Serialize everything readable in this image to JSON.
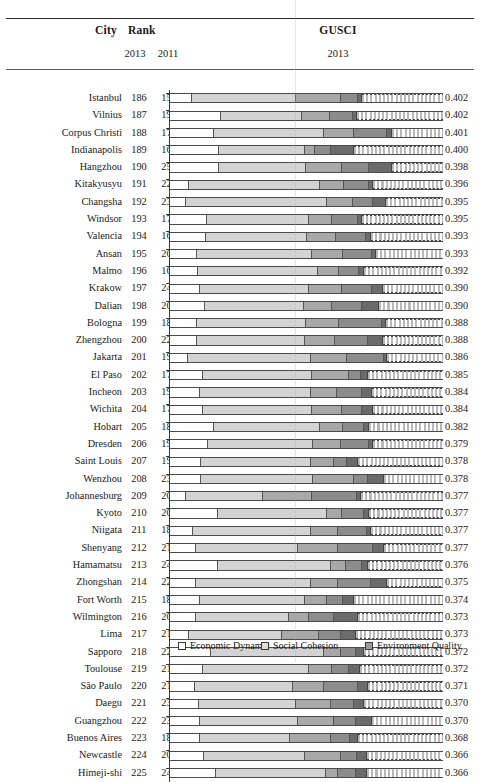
{
  "header": {
    "city_label": "City",
    "rank_label": "Rank",
    "rank_year_1": "2013",
    "rank_year_2": "2011",
    "gusci_label": "GUSCI",
    "gusci_year": "2013"
  },
  "legend": {
    "items": [
      {
        "name": "economic-dynamic",
        "label": "Economic Dynamic",
        "color": "#ffffff"
      },
      {
        "name": "social-cohesion",
        "label": "Social Cohesion",
        "color": "#dcdcdc"
      },
      {
        "name": "environment-quality",
        "label": "Environment Quality",
        "color": "#9c9c9c"
      }
    ]
  },
  "chart_data": {
    "type": "bar",
    "title": "",
    "subtitle": "",
    "xlabel": "",
    "ylabel": "",
    "grid": false,
    "legend_position": "bottom",
    "stacked": true,
    "series_names": [
      "Economic Dynamic",
      "Social Cohesion",
      "Environment Quality"
    ],
    "columns": [
      "City",
      "Rank 2013",
      "Rank 2011",
      "GUSCI 2013"
    ],
    "rows": [
      {
        "city": "Istanbul",
        "rank2013": "186",
        "rank2011": "158",
        "gusci": "0.402",
        "segs": [
          0.08,
          0.38,
          0.165,
          0.062,
          0.018
        ]
      },
      {
        "city": "Vilnius",
        "rank2013": "187",
        "rank2011": "197",
        "gusci": "0.402",
        "segs": [
          0.185,
          0.3,
          0.1,
          0.087,
          0.014
        ]
      },
      {
        "city": "Corpus Christi",
        "rank2013": "188",
        "rank2011": "173",
        "gusci": "0.401",
        "segs": [
          0.16,
          0.405,
          0.11,
          0.12,
          0.02
        ]
      },
      {
        "city": "Indianapolis",
        "rank2013": "189",
        "rank2011": "168",
        "gusci": "0.400",
        "segs": [
          0.18,
          0.315,
          0.035,
          0.06,
          0.085
        ]
      },
      {
        "city": "Hangzhou",
        "rank2013": "190",
        "rank2011": "251",
        "gusci": "0.398",
        "segs": [
          0.18,
          0.32,
          0.13,
          0.1,
          0.085
        ]
      },
      {
        "city": "Kitakyusyu",
        "rank2013": "191",
        "rank2011": "228",
        "gusci": "0.396",
        "segs": [
          0.068,
          0.48,
          0.09,
          0.09,
          0.015
        ]
      },
      {
        "city": "Changsha",
        "rank2013": "192",
        "rank2011": "234",
        "gusci": "0.395",
        "segs": [
          0.06,
          0.515,
          0.095,
          0.075,
          0.045
        ]
      },
      {
        "city": "Windsor",
        "rank2013": "193",
        "rank2011": "179",
        "gusci": "0.395",
        "segs": [
          0.135,
          0.375,
          0.085,
          0.095,
          0.015
        ]
      },
      {
        "city": "Valencia",
        "rank2013": "194",
        "rank2011": "167",
        "gusci": "0.393",
        "segs": [
          0.133,
          0.37,
          0.105,
          0.11,
          0.02
        ]
      },
      {
        "city": "Ansan",
        "rank2013": "195",
        "rank2011": "202",
        "gusci": "0.393",
        "segs": [
          0.1,
          0.42,
          0.115,
          0.105,
          0.013
        ]
      },
      {
        "city": "Malmo",
        "rank2013": "196",
        "rank2011": "160",
        "gusci": "0.392",
        "segs": [
          0.103,
          0.44,
          0.075,
          0.075,
          0.018
        ]
      },
      {
        "city": "Krakow",
        "rank2013": "197",
        "rank2011": "248",
        "gusci": "0.390",
        "segs": [
          0.11,
          0.4,
          0.12,
          0.11,
          0.04
        ]
      },
      {
        "city": "Dalian",
        "rank2013": "198",
        "rank2011": "207",
        "gusci": "0.390",
        "segs": [
          0.13,
          0.36,
          0.105,
          0.11,
          0.06
        ]
      },
      {
        "city": "Bologna",
        "rank2013": "199",
        "rank2011": "184",
        "gusci": "0.388",
        "segs": [
          0.1,
          0.4,
          0.12,
          0.155,
          0.015
        ]
      },
      {
        "city": "Zhengzhou",
        "rank2013": "200",
        "rank2011": "222",
        "gusci": "0.388",
        "segs": [
          0.1,
          0.395,
          0.11,
          0.12,
          0.055
        ]
      },
      {
        "city": "Jakarta",
        "rank2013": "201",
        "rank2011": "196",
        "gusci": "0.386",
        "segs": [
          0.065,
          0.45,
          0.135,
          0.135,
          0.01
        ]
      },
      {
        "city": "El Paso",
        "rank2013": "202",
        "rank2011": "170",
        "gusci": "0.385",
        "segs": [
          0.12,
          0.4,
          0.135,
          0.045,
          0.025
        ]
      },
      {
        "city": "Incheon",
        "rank2013": "203",
        "rank2011": "199",
        "gusci": "0.384",
        "segs": [
          0.11,
          0.405,
          0.095,
          0.095,
          0.035
        ]
      },
      {
        "city": "Wichita",
        "rank2013": "204",
        "rank2011": "174",
        "gusci": "0.384",
        "segs": [
          0.12,
          0.4,
          0.11,
          0.075,
          0.04
        ]
      },
      {
        "city": "Hobart",
        "rank2013": "205",
        "rank2011": "180",
        "gusci": "0.382",
        "segs": [
          0.16,
          0.39,
          0.085,
          0.075,
          0.018
        ]
      },
      {
        "city": "Dresden",
        "rank2013": "206",
        "rank2011": "194",
        "gusci": "0.379",
        "segs": [
          0.14,
          0.385,
          0.1,
          0.105,
          0.015
        ]
      },
      {
        "city": "Saint Louis",
        "rank2013": "207",
        "rank2011": "191",
        "gusci": "0.378",
        "segs": [
          0.115,
          0.4,
          0.085,
          0.05,
          0.04
        ]
      },
      {
        "city": "Wenzhou",
        "rank2013": "208",
        "rank2011": "235",
        "gusci": "0.378",
        "segs": [
          0.115,
          0.41,
          0.15,
          0.05,
          0.06
        ]
      },
      {
        "city": "Johannesburg",
        "rank2013": "209",
        "rank2011": "204",
        "gusci": "0.377",
        "segs": [
          0.06,
          0.28,
          0.18,
          0.165,
          0.015
        ]
      },
      {
        "city": "Kyoto",
        "rank2013": "210",
        "rank2011": "209",
        "gusci": "0.377",
        "segs": [
          0.175,
          0.4,
          0.055,
          0.08,
          0.02
        ]
      },
      {
        "city": "Niigata",
        "rank2013": "211",
        "rank2011": "183",
        "gusci": "0.377",
        "segs": [
          0.085,
          0.43,
          0.1,
          0.105,
          0.015
        ]
      },
      {
        "city": "Shenyang",
        "rank2013": "212",
        "rank2011": "212",
        "gusci": "0.377",
        "segs": [
          0.095,
          0.375,
          0.145,
          0.13,
          0.04
        ]
      },
      {
        "city": "Hamamatsu",
        "rank2013": "213",
        "rank2011": "242",
        "gusci": "0.376",
        "segs": [
          0.175,
          0.415,
          0.055,
          0.06,
          0.02
        ]
      },
      {
        "city": "Zhongshan",
        "rank2013": "214",
        "rank2011": "221",
        "gusci": "0.375",
        "segs": [
          0.095,
          0.42,
          0.1,
          0.12,
          0.06
        ]
      },
      {
        "city": "Fort Worth",
        "rank2013": "215",
        "rank2011": "187",
        "gusci": "0.374",
        "segs": [
          0.11,
          0.385,
          0.08,
          0.06,
          0.04
        ]
      },
      {
        "city": "Wilmington",
        "rank2013": "216",
        "rank2011": "208",
        "gusci": "0.373",
        "segs": [
          0.095,
          0.34,
          0.075,
          0.09,
          0.09
        ]
      },
      {
        "city": "Lima",
        "rank2013": "217",
        "rank2011": "219",
        "gusci": "0.373",
        "segs": [
          0.07,
          0.34,
          0.135,
          0.08,
          0.055
        ]
      },
      {
        "city": "Sapporo",
        "rank2013": "218",
        "rank2011": "220",
        "gusci": "0.372",
        "segs": [
          0.15,
          0.415,
          0.06,
          0.055,
          0.03
        ]
      },
      {
        "city": "Toulouse",
        "rank2013": "219",
        "rank2011": "213",
        "gusci": "0.372",
        "segs": [
          0.12,
          0.39,
          0.085,
          0.06,
          0.04
        ]
      },
      {
        "city": "São Paulo",
        "rank2013": "220",
        "rank2011": "214",
        "gusci": "0.371",
        "segs": [
          0.09,
          0.36,
          0.115,
          0.125,
          0.035
        ]
      },
      {
        "city": "Daegu",
        "rank2013": "221",
        "rank2011": "230",
        "gusci": "0.370",
        "segs": [
          0.105,
          0.355,
          0.13,
          0.085,
          0.035
        ]
      },
      {
        "city": "Guangzhou",
        "rank2013": "222",
        "rank2011": "237",
        "gusci": "0.370",
        "segs": [
          0.11,
          0.36,
          0.13,
          0.08,
          0.06
        ]
      },
      {
        "city": "Buenos Aires",
        "rank2013": "223",
        "rank2011": "185",
        "gusci": "0.368",
        "segs": [
          0.11,
          0.33,
          0.15,
          0.07,
          0.03
        ]
      },
      {
        "city": "Newcastle",
        "rank2013": "224",
        "rank2011": "201",
        "gusci": "0.366",
        "segs": [
          0.125,
          0.37,
          0.13,
          0.06,
          0.035
        ]
      },
      {
        "city": "Himeji-shi",
        "rank2013": "225",
        "rank2011": "249",
        "gusci": "0.366",
        "segs": [
          0.17,
          0.4,
          0.045,
          0.065,
          0.04
        ]
      }
    ]
  }
}
